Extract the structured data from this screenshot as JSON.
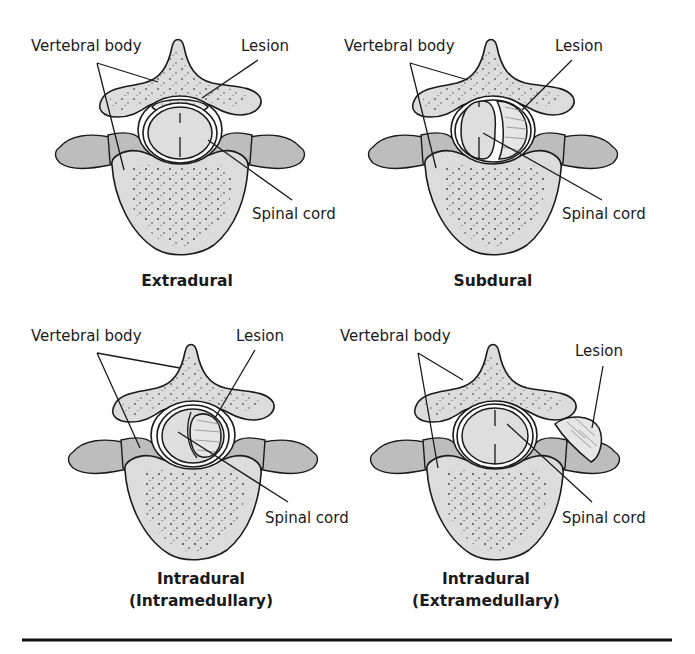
{
  "figure": {
    "panels": [
      {
        "id": "extradural",
        "caption_lines": [
          "Extradural"
        ],
        "labels": {
          "vertebral_body": "Vertebral body",
          "lesion": "Lesion",
          "spinal_cord": "Spinal cord"
        },
        "lesion_location": "outside dura, posterior to cord"
      },
      {
        "id": "subdural",
        "caption_lines": [
          "Subdural"
        ],
        "labels": {
          "vertebral_body": "Vertebral body",
          "lesion": "Lesion",
          "spinal_cord": "Spinal cord"
        },
        "lesion_location": "within dural sac, compressing cord laterally"
      },
      {
        "id": "intradural-intramedullary",
        "caption_lines": [
          "Intradural",
          "(Intramedullary)"
        ],
        "labels": {
          "vertebral_body": "Vertebral body",
          "lesion": "Lesion",
          "spinal_cord": "Spinal cord"
        },
        "lesion_location": "within the spinal cord"
      },
      {
        "id": "intradural-extramedullary",
        "caption_lines": [
          "Intradural",
          "(Extramedullary)"
        ],
        "labels": {
          "vertebral_body": "Vertebral body",
          "lesion": "Lesion",
          "spinal_cord": "Spinal cord"
        },
        "lesion_location": "outside canal, adjacent to lamina/transverse process"
      }
    ],
    "colors": {
      "bone": "#dcdcdc",
      "soft_tissue": "#bdbdbd",
      "outline": "#1a1a1a",
      "background": "#ffffff"
    }
  }
}
